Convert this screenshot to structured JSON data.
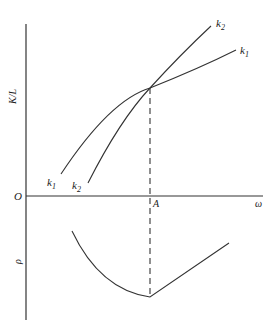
{
  "diagram": {
    "y_axis_upper_label": "K/L",
    "y_axis_lower_label": "ρ",
    "x_axis_label": "ω",
    "origin_label": "O",
    "point_label": "A",
    "curves": [
      {
        "name": "k",
        "sub": "1"
      },
      {
        "name": "k",
        "sub": "2"
      }
    ],
    "colors": {
      "line": "#333333",
      "background": "#ffffff"
    }
  }
}
